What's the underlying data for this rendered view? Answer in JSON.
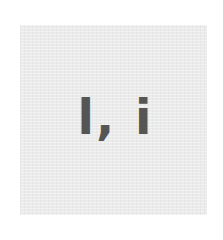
{
  "tile": {
    "text": "l, i",
    "background_color": "#ebebeb",
    "text_color": "#555555"
  }
}
